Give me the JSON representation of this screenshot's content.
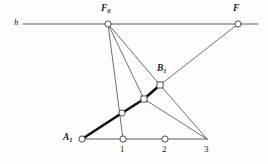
{
  "figure": {
    "width": 268,
    "height": 164,
    "background_color": "#fdfdfd",
    "line_color": "#4a4a4a",
    "thick_line_color": "#111111",
    "node_fill": "#ffffff",
    "node_stroke": "#3a3a3a"
  },
  "labels": {
    "h": "h",
    "F0_main": "F",
    "F0_sub": "0",
    "F": "F",
    "B1_main": "B",
    "B1_sub": "1",
    "A1_main": "A",
    "A1_sub": "1",
    "one": "1",
    "two": "2",
    "three": "3"
  },
  "geometry": {
    "axis_h": {
      "x1": 23,
      "y1": 24,
      "x2": 258,
      "y2": 24
    },
    "base_line": {
      "x1": 82,
      "y1": 139,
      "x2": 207,
      "y2": 139
    },
    "points": {
      "F0": {
        "x": 108,
        "y": 24,
        "shape": "circle"
      },
      "F": {
        "x": 238,
        "y": 24,
        "shape": "circle"
      },
      "B1": {
        "x": 160,
        "y": 85,
        "shape": "square"
      },
      "M2": {
        "x": 144,
        "y": 99,
        "shape": "square"
      },
      "M1": {
        "x": 122,
        "y": 113,
        "shape": "circle"
      },
      "A1": {
        "x": 82,
        "y": 139,
        "shape": "circle"
      },
      "N1": {
        "x": 123,
        "y": 139,
        "shape": "circle"
      },
      "N2": {
        "x": 165,
        "y": 139,
        "shape": "circle"
      },
      "N3": {
        "x": 207,
        "y": 139,
        "shape": "none"
      }
    },
    "rays_from_F0": [
      {
        "to": "N1",
        "x2": 123,
        "y2": 139
      },
      {
        "to": "M2",
        "x2": 144,
        "y2": 99
      },
      {
        "to": "B1",
        "x2": 160,
        "y2": 85
      }
    ],
    "ray_B1_to_F": {
      "x1": 160,
      "y1": 85,
      "x2": 238,
      "y2": 24
    },
    "rays_to_N3": [
      {
        "from": "B1",
        "x1": 160,
        "y1": 85
      },
      {
        "from": "M2",
        "x1": 144,
        "y1": 99
      }
    ],
    "thick_chain": [
      {
        "x": 82,
        "y": 139
      },
      {
        "x": 122,
        "y": 113
      },
      {
        "x": 144,
        "y": 99
      },
      {
        "x": 160,
        "y": 85
      }
    ]
  },
  "label_positions": {
    "h": {
      "x": 14,
      "y": 18
    },
    "F0": {
      "x": 101,
      "y": 4
    },
    "F": {
      "x": 233,
      "y": 4
    },
    "B1": {
      "x": 157,
      "y": 64
    },
    "A1": {
      "x": 63,
      "y": 133
    },
    "one": {
      "x": 120,
      "y": 145
    },
    "two": {
      "x": 162,
      "y": 145
    },
    "three": {
      "x": 204,
      "y": 145
    }
  }
}
